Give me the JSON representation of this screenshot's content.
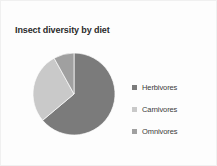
{
  "chart_data": {
    "type": "pie",
    "title": "Insect diversity by diet",
    "xlabel": "",
    "ylabel": "",
    "legend_position": "right",
    "grid": false,
    "categories": [
      "Herbivores",
      "Carnivores",
      "Omnivores"
    ],
    "values": [
      64,
      28,
      8
    ],
    "colors": [
      "#7b7b7b",
      "#c9c9c9",
      "#a0a0a0"
    ],
    "slices": [
      {
        "label": "Herbivores",
        "value": 64,
        "color": "#7b7b7b",
        "start_angle_deg": 0,
        "end_angle_deg": 230
      },
      {
        "label": "Carnivores",
        "value": 28,
        "color": "#c9c9c9",
        "start_angle_deg": 230,
        "end_angle_deg": 331
      },
      {
        "label": "Omnivores",
        "value": 8,
        "color": "#a0a0a0",
        "start_angle_deg": 331,
        "end_angle_deg": 360
      }
    ]
  },
  "legend": {
    "items": [
      {
        "label": "Herbivores",
        "color": "#7b7b7b"
      },
      {
        "label": "Carnivores",
        "color": "#c9c9c9"
      },
      {
        "label": "Omnivores",
        "color": "#a0a0a0"
      }
    ]
  },
  "canvas": {
    "background": "#fdfdfd",
    "border_color": "#f0f0f0",
    "title_color": "#2b2b2b",
    "label_color": "#3a3a3a"
  }
}
